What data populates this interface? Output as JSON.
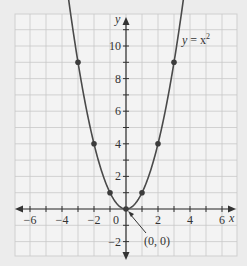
{
  "chart_data": {
    "type": "line",
    "title": "",
    "xlabel": "x",
    "ylabel": "y",
    "xlim": [
      -7,
      7
    ],
    "ylim": [
      -3,
      12
    ],
    "grid": true,
    "x_ticks": [
      -6,
      -4,
      -2,
      0,
      2,
      4,
      6
    ],
    "x_tick_labels": [
      "−6",
      "−4",
      "−2",
      "0",
      "2",
      "4",
      "6"
    ],
    "y_ticks": [
      -2,
      2,
      4,
      6,
      8,
      10
    ],
    "y_tick_labels": [
      "−2",
      "2",
      "4",
      "6",
      "8",
      "10"
    ],
    "series": [
      {
        "name": "y = x^2",
        "label": "y = x²",
        "function": "x^2",
        "curve_x_range": [
          -3.7,
          3.7
        ],
        "points": [
          {
            "x": -3,
            "y": 9
          },
          {
            "x": -2,
            "y": 4
          },
          {
            "x": -1,
            "y": 1
          },
          {
            "x": 0,
            "y": 0
          },
          {
            "x": 1,
            "y": 1
          },
          {
            "x": 2,
            "y": 4
          },
          {
            "x": 3,
            "y": 9
          }
        ]
      }
    ],
    "annotations": [
      {
        "text": "(0, 0)",
        "points_to": {
          "x": 0,
          "y": 0
        }
      }
    ],
    "colors": {
      "background": "#ececec",
      "grid_bg": "#f3f3f3",
      "grid_line": "#c8c8c8",
      "axis": "#333333",
      "curve": "#4a4a4a",
      "point": "#3c3c3c"
    }
  },
  "labels": {
    "curve_label_y": "y",
    "curve_label_eq": " = x",
    "curve_label_exp": "2",
    "x_axis": "x",
    "y_axis": "y",
    "origin_annotation": "(0, 0)"
  }
}
